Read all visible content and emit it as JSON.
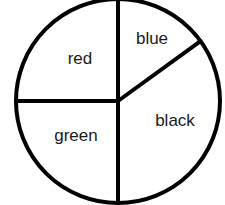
{
  "chart_data": {
    "type": "pie",
    "title": "",
    "start_angle_deg_from_top": 0,
    "direction": "clockwise",
    "slices": [
      {
        "label": "blue",
        "value": 15,
        "angle_deg": 54
      },
      {
        "label": "black",
        "value": 35,
        "angle_deg": 126
      },
      {
        "label": "green",
        "value": 25,
        "angle_deg": 90
      },
      {
        "label": "red",
        "value": 25,
        "angle_deg": 90
      }
    ],
    "categories": [
      "blue",
      "black",
      "green",
      "red"
    ],
    "values": [
      15,
      35,
      25,
      25
    ],
    "fill": "#ffffff",
    "stroke": "#000000",
    "legend": "none",
    "labels_inside_slices": true
  }
}
